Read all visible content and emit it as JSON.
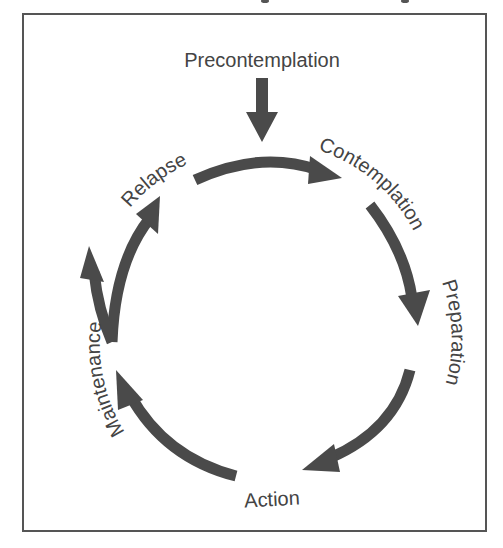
{
  "diagram": {
    "type": "cycle",
    "title_fragment": "",
    "colors": {
      "frame": "#555555",
      "arrow": "#4a4a4a",
      "text": "#444444",
      "background": "#ffffff"
    },
    "entry_label": "Precontemplation",
    "stages": [
      {
        "id": "contemplation",
        "label": "Contemplation"
      },
      {
        "id": "preparation",
        "label": "Preparation"
      },
      {
        "id": "action",
        "label": "Action"
      },
      {
        "id": "maintenance",
        "label": "Maintenance"
      },
      {
        "id": "relapse",
        "label": "Relapse"
      }
    ],
    "edges": [
      {
        "from": "Precontemplation",
        "to": "Contemplation"
      },
      {
        "from": "Relapse",
        "to": "Contemplation"
      },
      {
        "from": "Contemplation",
        "to": "Preparation"
      },
      {
        "from": "Preparation",
        "to": "Action"
      },
      {
        "from": "Action",
        "to": "Maintenance"
      },
      {
        "from": "Maintenance",
        "to": "Relapse"
      },
      {
        "from": "Maintenance",
        "to": "Maintenance (exit)"
      }
    ]
  }
}
